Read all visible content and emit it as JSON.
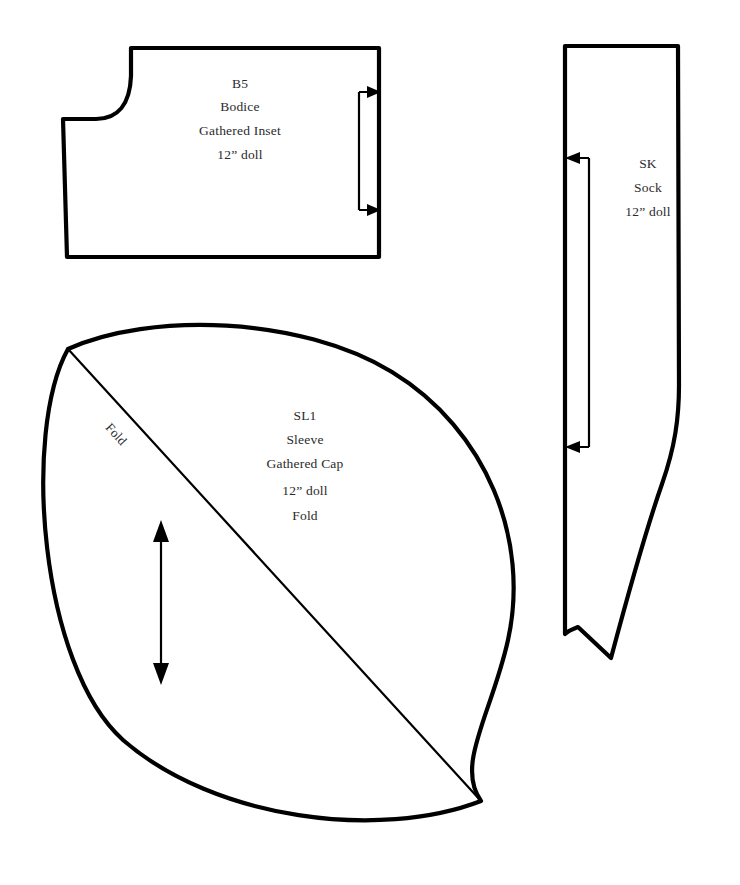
{
  "sheet": {
    "title": "Doll Clothing Sewing Pattern Sheet",
    "background_color": "#ffffff",
    "ink_color": "#000000",
    "text_color": "#2b2b2b",
    "width": 740,
    "height": 885
  },
  "pieces": [
    {
      "id": "B5",
      "shape": "bodice-gathered-inset",
      "labels": {
        "code": "B5",
        "name": "Bodice",
        "detail": "Gathered Inset",
        "size": "12” doll"
      },
      "markings": {
        "grainline": "bracket-double-arrow-right",
        "neckline": "concave-curve-top-left"
      }
    },
    {
      "id": "SK",
      "shape": "sock",
      "labels": {
        "code": "SK",
        "name": "Sock",
        "size": "12” doll"
      },
      "markings": {
        "grainline": "bracket-double-arrow-left"
      }
    },
    {
      "id": "SL1",
      "shape": "sleeve-lens",
      "labels": {
        "code": "SL1",
        "name": "Sleeve",
        "detail": "Gathered Cap",
        "size": "12” doll",
        "fold": "Fold"
      },
      "markings": {
        "grainline": "double-headed-arrow-vertical",
        "fold_line": "diagonal",
        "fold_edge_label": "Fold"
      }
    }
  ]
}
